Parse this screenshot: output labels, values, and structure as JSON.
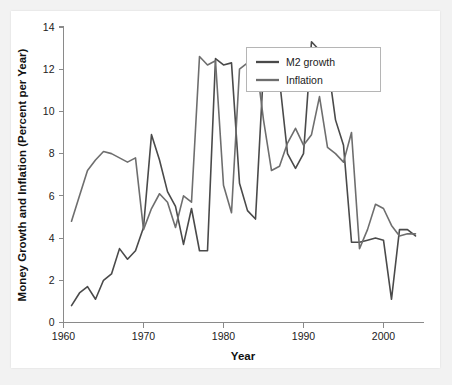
{
  "chart_data": {
    "type": "line",
    "title": "",
    "xlabel": "Year",
    "ylabel": "Money Growth and Inflation (Percent per Year)",
    "xlim": [
      1960,
      2005
    ],
    "ylim": [
      0,
      14
    ],
    "xticks": [
      1960,
      1970,
      1980,
      1990,
      2000
    ],
    "yticks": [
      0,
      2,
      4,
      6,
      8,
      10,
      12,
      14
    ],
    "grid": false,
    "legend_position": "top-right",
    "x": [
      1961,
      1962,
      1963,
      1964,
      1965,
      1966,
      1967,
      1968,
      1969,
      1970,
      1971,
      1972,
      1973,
      1974,
      1975,
      1976,
      1977,
      1978,
      1979,
      1980,
      1981,
      1982,
      1983,
      1984,
      1985,
      1986,
      1987,
      1988,
      1989,
      1990,
      1991,
      1992,
      1993,
      1994,
      1995,
      1996,
      1997,
      1998,
      1999,
      2000,
      2001,
      2002,
      2003,
      2004
    ],
    "series": [
      {
        "name": "M2 growth",
        "color": "#4a4a4a",
        "values": [
          0.8,
          1.4,
          1.7,
          1.1,
          2.0,
          2.3,
          3.5,
          3.0,
          3.4,
          4.5,
          8.9,
          7.7,
          6.2,
          5.5,
          3.7,
          5.4,
          3.4,
          3.4,
          12.5,
          12.2,
          12.3,
          6.6,
          5.3,
          4.9,
          12.0,
          12.5,
          11.5,
          8.0,
          7.3,
          8.0,
          13.3,
          12.9,
          12.4,
          9.6,
          8.4,
          3.8,
          3.8,
          3.9,
          4.0,
          3.9,
          1.1,
          4.4,
          4.4,
          4.1
        ]
      },
      {
        "name": "Inflation",
        "color": "#6e6e6e",
        "values": [
          4.8,
          6.0,
          7.2,
          7.7,
          8.1,
          8.0,
          7.8,
          7.6,
          7.8,
          4.4,
          5.4,
          6.1,
          5.7,
          4.5,
          6.0,
          5.7,
          12.6,
          12.2,
          12.4,
          6.5,
          5.2,
          12.0,
          12.3,
          12.6,
          9.6,
          7.2,
          7.4,
          8.5,
          9.2,
          8.4,
          8.9,
          10.7,
          8.3,
          8.0,
          7.6,
          9.0,
          3.5,
          4.4,
          5.6,
          5.4,
          4.6,
          4.1,
          4.2,
          4.2
        ]
      }
    ]
  },
  "legend": {
    "entries": [
      {
        "label": "M2 growth",
        "color": "#4a4a4a"
      },
      {
        "label": "Inflation",
        "color": "#6e6e6e"
      }
    ]
  },
  "axes": {
    "x_title": "Year",
    "y_title": "Money Growth and Inflation (Percent per Year)",
    "x_tick_labels": [
      "1960",
      "1970",
      "1980",
      "1990",
      "2000"
    ],
    "y_tick_labels": [
      "0",
      "2",
      "4",
      "6",
      "8",
      "10",
      "12",
      "14"
    ]
  }
}
